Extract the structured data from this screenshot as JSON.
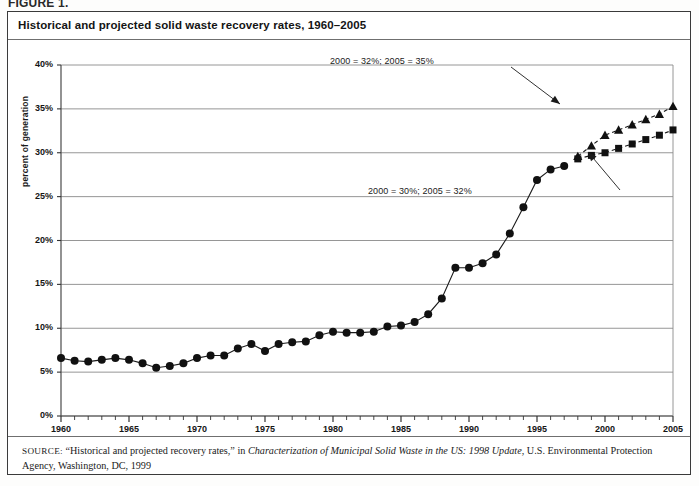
{
  "page": {
    "cropped_heading_above": "FIGURE 1.",
    "title": "Historical and projected solid waste recovery rates, 1960–2005"
  },
  "source_note": {
    "label": "SOURCE:",
    "part1": " “Historical and projected recovery rates,” in ",
    "italic": "Characterization of Municipal Solid Waste in the US: 1998 Update",
    "part2": ", U.S. Environmental Protection Agency, Washington, DC, 1999"
  },
  "annotations": [
    {
      "id": "upper",
      "text": "2000 = 32%; 2005 = 35%"
    },
    {
      "id": "lower",
      "text": "2000 = 30%; 2005 = 32%"
    }
  ],
  "chart_data": {
    "type": "line",
    "title": "Historical and projected solid waste recovery rates, 1960–2005",
    "xlabel": "",
    "ylabel": "percent of generation",
    "xlim": [
      1960,
      2005
    ],
    "ylim": [
      0,
      40
    ],
    "ytick_labels": [
      "0%",
      "5%",
      "10%",
      "15%",
      "20%",
      "25%",
      "30%",
      "35%",
      "40%"
    ],
    "ytick_values": [
      0,
      5,
      10,
      15,
      20,
      25,
      30,
      35,
      40
    ],
    "xtick_labels": [
      "1960",
      "1965",
      "1970",
      "1975",
      "1980",
      "1985",
      "1990",
      "1995",
      "2000",
      "2005"
    ],
    "xtick_values": [
      1960,
      1965,
      1970,
      1975,
      1980,
      1985,
      1990,
      1995,
      2000,
      2005
    ],
    "minor_xticks_every": 1,
    "grid": "horizontal",
    "legend": "none",
    "series": [
      {
        "name": "Historical recovery rate",
        "marker": "circle",
        "linestyle": "solid",
        "x": [
          1960,
          1961,
          1962,
          1963,
          1964,
          1965,
          1966,
          1967,
          1968,
          1969,
          1970,
          1971,
          1972,
          1973,
          1974,
          1975,
          1976,
          1977,
          1978,
          1979,
          1980,
          1981,
          1982,
          1983,
          1984,
          1985,
          1986,
          1987,
          1988,
          1989,
          1990,
          1991,
          1992,
          1993,
          1994,
          1995,
          1996,
          1997
        ],
        "y": [
          6.6,
          6.3,
          6.2,
          6.4,
          6.6,
          6.4,
          6.0,
          5.5,
          5.7,
          6.0,
          6.6,
          6.9,
          6.9,
          7.7,
          8.2,
          7.4,
          8.2,
          8.4,
          8.5,
          9.2,
          9.6,
          9.5,
          9.5,
          9.6,
          10.2,
          10.3,
          10.7,
          11.6,
          13.4,
          16.9,
          16.9,
          17.4,
          18.4,
          20.8,
          23.8,
          26.9,
          28.1,
          28.5
        ]
      },
      {
        "name": "Projected recovery rate (high)",
        "marker": "triangle",
        "linestyle": "dashed",
        "x": [
          1998,
          1999,
          2000,
          2001,
          2002,
          2003,
          2004,
          2005
        ],
        "y": [
          29.6,
          30.8,
          32.0,
          32.6,
          33.2,
          33.8,
          34.4,
          35.3
        ]
      },
      {
        "name": "Projected recovery rate (low)",
        "marker": "square",
        "linestyle": "dashed",
        "x": [
          1998,
          1999,
          2000,
          2001,
          2002,
          2003,
          2004,
          2005
        ],
        "y": [
          29.3,
          29.7,
          30.0,
          30.5,
          31.0,
          31.5,
          32.0,
          32.6
        ]
      }
    ],
    "annotations": [
      {
        "text": "2000 = 32%; 2005 = 35%",
        "points_to_series": "Projected recovery rate (high)",
        "points_to_x": 2000,
        "points_to_y": 32
      },
      {
        "text": "2000 = 30%; 2005 = 32%",
        "points_to_series": "Projected recovery rate (low)",
        "points_to_x": 2000,
        "points_to_y": 30
      }
    ]
  }
}
